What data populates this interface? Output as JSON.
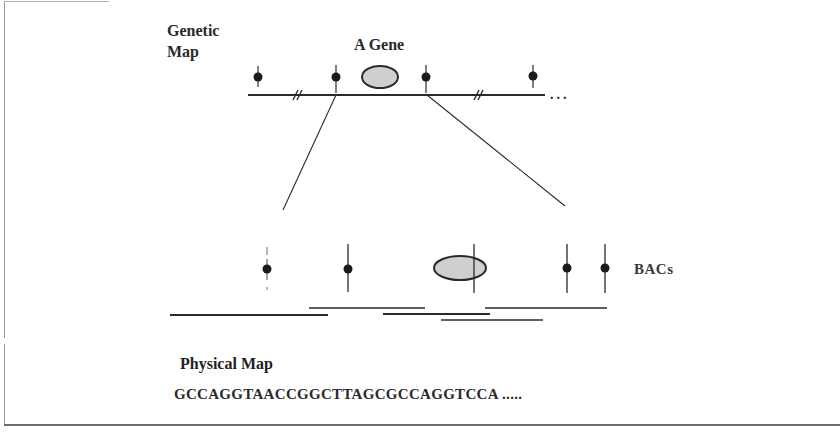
{
  "labels": {
    "genetic_map_line1": "Genetic",
    "genetic_map_line2": "Map",
    "gene": "A Gene",
    "bacs": "BACs",
    "physical_map": "Physical Map",
    "sequence": "GCCAGGTAACCGGCTTAGCGCCAGGTCCA .....",
    "continuation": "..."
  },
  "colors": {
    "line": "#2a2a2a",
    "marker": "#1a1a1a",
    "gene_fill": "#cfcfcf",
    "gene_stroke": "#2a2a2a"
  },
  "genetic_map": {
    "chromosome_line": {
      "x1": 248,
      "x2": 545,
      "y": 95
    },
    "markers_x": [
      258,
      336,
      426,
      533
    ],
    "break_marks_x": [
      297,
      478
    ],
    "gene_oval": {
      "cx": 380,
      "cy": 77,
      "rx": 18,
      "ry": 11
    }
  },
  "zoom_lines": [
    {
      "x1": 336,
      "y1": 95,
      "x2": 283,
      "y2": 210
    },
    {
      "x1": 427,
      "y1": 95,
      "x2": 565,
      "y2": 206
    }
  ],
  "physical_region": {
    "markers_x": [
      267,
      348,
      567,
      605
    ],
    "gene_oval": {
      "cx": 460,
      "cy": 268,
      "rx": 26,
      "ry": 12
    },
    "bac_clones": [
      {
        "x1": 170,
        "x2": 328,
        "y": 315
      },
      {
        "x1": 309,
        "x2": 425,
        "y": 308
      },
      {
        "x1": 383,
        "x2": 490,
        "y": 314
      },
      {
        "x1": 441,
        "x2": 543,
        "y": 320
      },
      {
        "x1": 485,
        "x2": 607,
        "y": 308
      }
    ]
  }
}
